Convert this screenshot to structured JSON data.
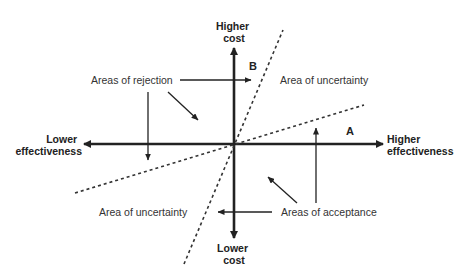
{
  "diagram": {
    "axes": {
      "y_top": [
        "Higher",
        "cost"
      ],
      "y_bottom": [
        "Lower",
        "cost"
      ],
      "x_left": [
        "Lower",
        "effectiveness"
      ],
      "x_right": [
        "Higher",
        "effectiveness"
      ]
    },
    "threshold_lines": {
      "a_label": "A",
      "b_label": "B"
    },
    "areas": {
      "rejection": "Areas of rejection",
      "acceptance": "Areas of acceptance",
      "uncertainty_upper": "Area of uncertainty",
      "uncertainty_lower": "Area of uncertainty"
    },
    "colors": {
      "axis": "#222222",
      "text": "#333333",
      "background": "#ffffff"
    }
  }
}
